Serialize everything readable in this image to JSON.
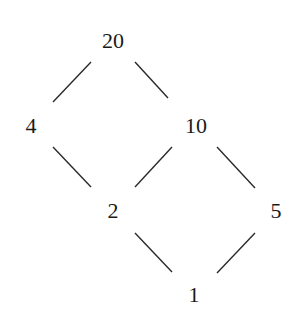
{
  "diagram": {
    "type": "hasse-diagram",
    "nodes": [
      {
        "id": "n20",
        "label": "20",
        "x": 113,
        "y": 48
      },
      {
        "id": "n4",
        "label": "4",
        "x": 31,
        "y": 133
      },
      {
        "id": "n10",
        "label": "10",
        "x": 196,
        "y": 133
      },
      {
        "id": "n2",
        "label": "2",
        "x": 113,
        "y": 218
      },
      {
        "id": "n5",
        "label": "5",
        "x": 276,
        "y": 218
      },
      {
        "id": "n1",
        "label": "1",
        "x": 194,
        "y": 302
      }
    ],
    "edges": [
      {
        "from": "20",
        "to": "4",
        "x1": 91,
        "y1": 62,
        "x2": 53,
        "y2": 102
      },
      {
        "from": "20",
        "to": "10",
        "x1": 135,
        "y1": 62,
        "x2": 168,
        "y2": 98
      },
      {
        "from": "4",
        "to": "2",
        "x1": 53,
        "y1": 147,
        "x2": 91,
        "y2": 187
      },
      {
        "from": "10",
        "to": "2",
        "x1": 172,
        "y1": 147,
        "x2": 135,
        "y2": 187
      },
      {
        "from": "10",
        "to": "5",
        "x1": 217,
        "y1": 147,
        "x2": 255,
        "y2": 188
      },
      {
        "from": "2",
        "to": "1",
        "x1": 135,
        "y1": 233,
        "x2": 172,
        "y2": 272
      },
      {
        "from": "5",
        "to": "1",
        "x1": 255,
        "y1": 233,
        "x2": 217,
        "y2": 273
      }
    ]
  }
}
